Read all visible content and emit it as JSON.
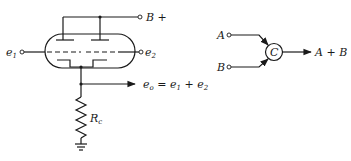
{
  "figure": {
    "left_circuit": {
      "description": "Dual triode cathode-follower adder",
      "supply_label": "B +",
      "input1_label": "e",
      "input1_sub": "1",
      "input2_label": "e",
      "input2_sub": "2",
      "output_label": "e",
      "output_sub": "o",
      "output_eq": " = ",
      "output_term1": "e",
      "output_term1_sub": "1",
      "output_plus": " + ",
      "output_term2": "e",
      "output_term2_sub": "2",
      "resistor_label": "R",
      "resistor_sub": "c"
    },
    "right_block": {
      "description": "Block symbol of adder",
      "input_a_label": "A",
      "input_b_label": "B",
      "node_label": "C",
      "output_label_a": "A",
      "output_plus": " + ",
      "output_label_b": "B"
    },
    "colors": {
      "ink": "#1a1a1a",
      "background": "#ffffff"
    }
  }
}
